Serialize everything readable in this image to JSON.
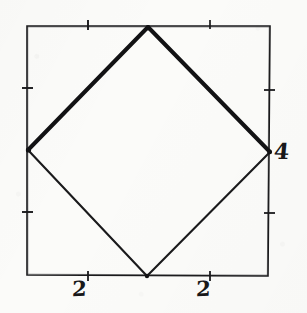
{
  "figure": {
    "background_color": "#fbfbf9",
    "ink_color": "#1a1a1c",
    "outer_square": {
      "name": "outer-square",
      "stroke_width_px": 1.6,
      "corners": {
        "top_left": [
          27,
          26
        ],
        "top_right": [
          270,
          26
        ],
        "bottom_right": [
          268,
          276
        ],
        "bottom_left": [
          27,
          275
        ]
      },
      "path": "M27,26 L270,26 L268,276 L27,275 Z"
    },
    "inscribed_square": {
      "name": "inscribed-square",
      "vertices": {
        "top": [
          148,
          27
        ],
        "right": [
          270,
          152
        ],
        "bottom": [
          147,
          276
        ],
        "left": [
          28,
          150
        ]
      },
      "edges": [
        {
          "name": "edge-top-left",
          "path": "M28,150 L148,27",
          "stroke_width_px": 4.0
        },
        {
          "name": "edge-top-right",
          "path": "M148,27 L270,152",
          "stroke_width_px": 4.0
        },
        {
          "name": "edge-bottom-right",
          "path": "M270,152 L147,276",
          "stroke_width_px": 2.1
        },
        {
          "name": "edge-bottom-left",
          "path": "M147,276 L28,150",
          "stroke_width_px": 2.1
        }
      ]
    },
    "ticks": {
      "top": [
        {
          "x": 88,
          "y": 26
        },
        {
          "x": 210,
          "y": 26
        }
      ],
      "bottom": [
        {
          "x": 88,
          "y": 276
        },
        {
          "x": 210,
          "y": 276
        }
      ],
      "left": [
        {
          "x": 27,
          "y": 88
        },
        {
          "x": 27,
          "y": 212
        }
      ],
      "right": [
        {
          "x": 269,
          "y": 90
        },
        {
          "x": 269,
          "y": 213
        }
      ],
      "length_px": 7
    },
    "labels": [
      {
        "id": "bottom-left",
        "text": "2",
        "x": 83,
        "y": 290,
        "edge": "bottom"
      },
      {
        "id": "bottom-right",
        "text": "2",
        "x": 207,
        "y": 290,
        "edge": "bottom"
      },
      {
        "id": "right-side",
        "text": "4",
        "x": 285,
        "y": 152,
        "edge": "right"
      }
    ]
  },
  "chart_data": {
    "type": "diagram",
    "xlabel": "",
    "ylabel": "",
    "shapes": [
      {
        "name": "outer square",
        "kind": "square",
        "points": [
          [
            0,
            4
          ],
          [
            4,
            4
          ],
          [
            4,
            0
          ],
          [
            0,
            0
          ]
        ],
        "side_length": 4,
        "stroke": "thin"
      },
      {
        "name": "inscribed rotated square",
        "kind": "square",
        "points": [
          [
            2,
            4
          ],
          [
            4,
            2
          ],
          [
            2,
            0
          ],
          [
            0,
            2
          ]
        ],
        "side_length": 2.828,
        "stroke": "mixed-upper-thick"
      }
    ],
    "annotations": [
      {
        "text": "2",
        "points_to": "bottom edge left half",
        "value": 2
      },
      {
        "text": "2",
        "points_to": "bottom edge right half",
        "value": 2
      },
      {
        "text": "4",
        "points_to": "right edge total height",
        "value": 4
      }
    ],
    "tick_values": {
      "x": [
        2
      ],
      "y": [
        2
      ]
    },
    "xlim": [
      0,
      4
    ],
    "ylim": [
      0,
      4
    ],
    "grid": false,
    "legend": false
  }
}
